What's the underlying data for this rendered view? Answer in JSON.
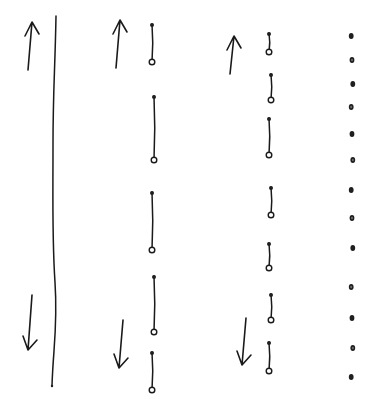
{
  "diagram": {
    "ink_color": "#1a1a1a",
    "background": "#ffffff",
    "columns": [
      {
        "name": "continuous-line",
        "arrows": [
          {
            "direction": "up",
            "x": 30,
            "y_top": 22,
            "y_bottom": 70
          },
          {
            "direction": "down",
            "x": 30,
            "y_top": 295,
            "y_bottom": 350
          }
        ],
        "line": {
          "x": 55,
          "y_top": 16,
          "y_bottom": 386
        }
      },
      {
        "name": "segmented-line",
        "arrows": [
          {
            "direction": "up",
            "x": 118,
            "y_top": 20,
            "y_bottom": 68
          },
          {
            "direction": "down",
            "x": 121,
            "y_top": 320,
            "y_bottom": 368
          }
        ],
        "segments": [
          {
            "y_top": 24,
            "y_bottom": 62
          },
          {
            "y_top": 96,
            "y_bottom": 160
          },
          {
            "y_top": 192,
            "y_bottom": 250
          },
          {
            "y_top": 276,
            "y_bottom": 332
          },
          {
            "y_top": 352,
            "y_bottom": 390
          }
        ],
        "x": 153
      },
      {
        "name": "short-segments",
        "arrows": [
          {
            "direction": "up",
            "x": 232,
            "y_top": 36,
            "y_bottom": 74
          },
          {
            "direction": "down",
            "x": 244,
            "y_top": 318,
            "y_bottom": 365
          }
        ],
        "segments": [
          {
            "y_top": 33,
            "y_bottom": 52
          },
          {
            "y_top": 74,
            "y_bottom": 100
          },
          {
            "y_top": 118,
            "y_bottom": 155
          },
          {
            "y_top": 187,
            "y_bottom": 215
          },
          {
            "y_top": 243,
            "y_bottom": 268
          },
          {
            "y_top": 294,
            "y_bottom": 320
          },
          {
            "y_top": 342,
            "y_bottom": 371
          }
        ],
        "x": 270
      },
      {
        "name": "isolated-dots",
        "x": 352,
        "dots_y": [
          36,
          60,
          84,
          107,
          134,
          160,
          190,
          218,
          248,
          287,
          318,
          348,
          377
        ]
      }
    ]
  }
}
